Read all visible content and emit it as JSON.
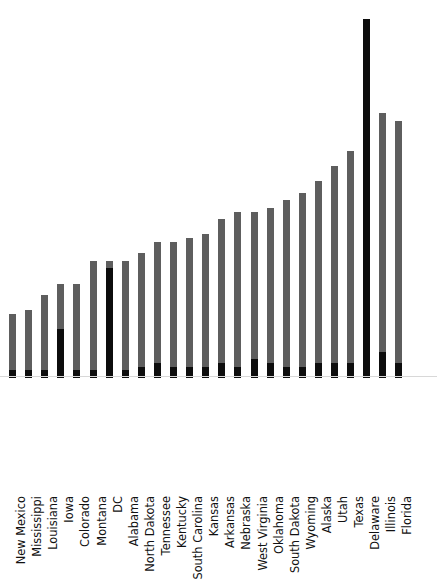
{
  "chart_data": {
    "type": "bar",
    "subtype": "stacked-bar",
    "title": "",
    "subtitle": "",
    "xlabel": "",
    "ylabel": "",
    "grid": false,
    "legend": false,
    "legend_position": "none",
    "orientation": "vertical",
    "tick_labels_rotation": -90,
    "axis_visible": true,
    "ylim": [
      0,
      100
    ],
    "colors": {
      "series_top": "#5e5e5e",
      "series_bottom": "#0d0d0d",
      "background": "#ffffff",
      "axis": "#d8d8d8",
      "label_text": "#111111"
    },
    "categories": [
      "New Mexico",
      "Mississippi",
      "Louisiana",
      "Iowa",
      "Colorado",
      "Montana",
      "DC",
      "Alabama",
      "North Dakota",
      "Tennessee",
      "Kentucky",
      "South Carolina",
      "Kansas",
      "Arkansas",
      "Nebraska",
      "West Virginia",
      "Oklahoma",
      "South Dakota",
      "Wyoming",
      "Alaska",
      "Utah",
      "Texas",
      "Delaware",
      "Illinois",
      "Florida"
    ],
    "series": [
      {
        "name": "lower-segment",
        "color": "#0d0d0d",
        "values": [
          2,
          2,
          2,
          13,
          2,
          2,
          29,
          2,
          3,
          4,
          3,
          3,
          3,
          4,
          3,
          5,
          4,
          3,
          3,
          4,
          4,
          4,
          95,
          7,
          4
        ]
      },
      {
        "name": "upper-segment",
        "color": "#5e5e5e",
        "values": [
          15,
          16,
          20,
          12,
          23,
          29,
          2,
          29,
          30,
          32,
          33,
          34,
          35,
          38,
          41,
          39,
          41,
          44,
          46,
          48,
          52,
          56,
          0,
          63,
          64
        ]
      }
    ],
    "totals": [
      17,
      18,
      22,
      25,
      25,
      31,
      31,
      31,
      33,
      36,
      36,
      37,
      38,
      42,
      44,
      44,
      45,
      47,
      49,
      52,
      56,
      60,
      95,
      70,
      68
    ]
  }
}
